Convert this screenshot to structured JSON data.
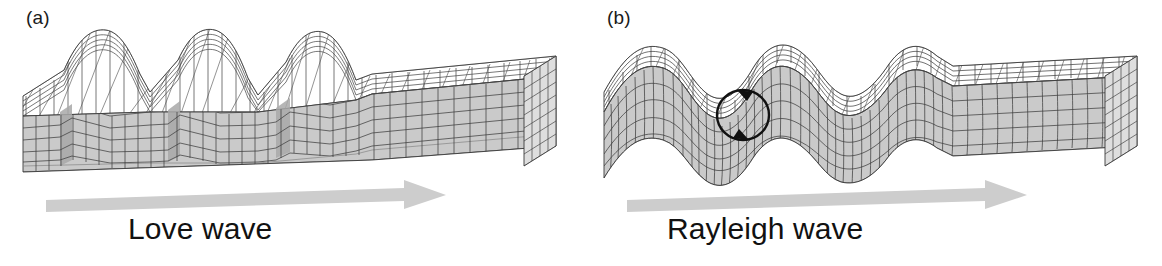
{
  "figure": {
    "background": "#ffffff",
    "panels": [
      {
        "tag": "(a)",
        "caption": "Love wave",
        "wave_type": "Love",
        "motion": "horizontal-transverse-shear",
        "arrow_label": "propagation-direction",
        "arrow_direction": "right",
        "particle_motion_marker": false
      },
      {
        "tag": "(b)",
        "caption": "Rayleigh wave",
        "wave_type": "Rayleigh",
        "motion": "vertical-elliptical-retrograde",
        "arrow_label": "propagation-direction",
        "arrow_direction": "right",
        "particle_motion_marker": true
      }
    ]
  },
  "colors": {
    "grid_line": "#3a3a3a",
    "top_face": "#ffffff",
    "front_face": "#cacaca",
    "side_face": "#dedede",
    "shadow_face": "#a9a9a9",
    "arrow": "#cdcdcd",
    "text": "#111111"
  }
}
